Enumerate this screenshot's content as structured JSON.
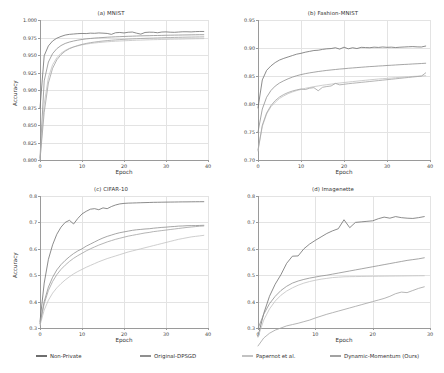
{
  "figure": {
    "xlabel": "Epoch",
    "ylabel": "Accuracy",
    "series_colors": [
      "#6e6e6e",
      "#8f8f8f",
      "#c2c2c2",
      "#a2a2a2"
    ]
  },
  "legend": {
    "position": "bottom",
    "items": [
      {
        "label": "Non-Private",
        "color": "#6e6e6e"
      },
      {
        "label": "Original-DPSGD",
        "color": "#8f8f8f"
      },
      {
        "label": "Papernot et al.",
        "color": "#c2c2c2"
      },
      {
        "label": "Dynamic-Momentum (Ours)",
        "color": "#a2a2a2"
      }
    ]
  },
  "chart_data": [
    {
      "type": "line",
      "title": "(a) MNIST",
      "xlabel": "Epoch",
      "ylabel": "Accuracy",
      "xlim": [
        0,
        40
      ],
      "ylim": [
        0.8,
        1.0
      ],
      "xticks": [
        0,
        10,
        20,
        30,
        40
      ],
      "yticks": [
        0.8,
        0.825,
        0.85,
        0.875,
        0.9,
        0.925,
        0.95,
        0.975,
        1.0
      ],
      "ytick_labels": [
        "0.800",
        "0.825",
        "0.850",
        "0.875",
        "0.900",
        "0.925",
        "0.950",
        "0.975",
        "1.000"
      ],
      "grid": true,
      "x": [
        0,
        1,
        2,
        3,
        4,
        5,
        6,
        7,
        8,
        9,
        10,
        11,
        12,
        13,
        14,
        15,
        16,
        17,
        18,
        19,
        20,
        21,
        22,
        23,
        24,
        25,
        26,
        27,
        28,
        29,
        30,
        31,
        32,
        33,
        34,
        35,
        36,
        37,
        38,
        39
      ],
      "series": [
        {
          "name": "Non-Private",
          "values": [
            0.874,
            0.949,
            0.963,
            0.97,
            0.974,
            0.9765,
            0.9785,
            0.9795,
            0.98,
            0.9805,
            0.9808,
            0.9806,
            0.9812,
            0.981,
            0.9815,
            0.9812,
            0.9808,
            0.9795,
            0.9818,
            0.9822,
            0.9815,
            0.9825,
            0.9828,
            0.9812,
            0.9798,
            0.9822,
            0.9826,
            0.9825,
            0.9818,
            0.9828,
            0.983,
            0.9826,
            0.9824,
            0.9828,
            0.9832,
            0.9832,
            0.983,
            0.9834,
            0.9836,
            0.9836
          ]
        },
        {
          "name": "Original-DPSGD",
          "values": [
            0.803,
            0.913,
            0.94,
            0.952,
            0.959,
            0.9635,
            0.9665,
            0.9685,
            0.97,
            0.9712,
            0.9722,
            0.973,
            0.9736,
            0.9742,
            0.9746,
            0.975,
            0.9754,
            0.9757,
            0.976,
            0.9762,
            0.9765,
            0.9767,
            0.9769,
            0.9771,
            0.9773,
            0.9775,
            0.9776,
            0.9778,
            0.9779,
            0.978,
            0.9782,
            0.9783,
            0.9784,
            0.9785,
            0.9786,
            0.9787,
            0.9788,
            0.9789,
            0.979,
            0.979
          ]
        },
        {
          "name": "Papernot et al.",
          "values": [
            0.801,
            0.88,
            0.918,
            0.936,
            0.946,
            0.9525,
            0.9565,
            0.9595,
            0.9615,
            0.963,
            0.9645,
            0.9655,
            0.9665,
            0.9672,
            0.9678,
            0.9684,
            0.9689,
            0.9693,
            0.9697,
            0.97,
            0.9703,
            0.9706,
            0.9708,
            0.9711,
            0.9713,
            0.9715,
            0.9717,
            0.9719,
            0.972,
            0.9722,
            0.9723,
            0.9725,
            0.9726,
            0.9727,
            0.9728,
            0.973,
            0.9731,
            0.9732,
            0.9733,
            0.9734
          ]
        },
        {
          "name": "Dynamic-Momentum (Ours)",
          "values": [
            0.8,
            0.868,
            0.91,
            0.931,
            0.943,
            0.9505,
            0.9555,
            0.959,
            0.9615,
            0.9635,
            0.9652,
            0.9665,
            0.9676,
            0.9685,
            0.9693,
            0.97,
            0.9706,
            0.9711,
            0.9716,
            0.972,
            0.9724,
            0.9727,
            0.973,
            0.9733,
            0.9736,
            0.9738,
            0.974,
            0.9742,
            0.9744,
            0.9746,
            0.9748,
            0.9749,
            0.9751,
            0.9752,
            0.9754,
            0.9755,
            0.9756,
            0.9757,
            0.9758,
            0.9759
          ]
        }
      ]
    },
    {
      "type": "line",
      "title": "(b) Fashion-MNIST",
      "xlabel": "Epoch",
      "ylabel": "",
      "xlim": [
        0,
        40
      ],
      "ylim": [
        0.7,
        0.95
      ],
      "xticks": [
        0,
        10,
        20,
        30,
        40
      ],
      "yticks": [
        0.7,
        0.75,
        0.8,
        0.85,
        0.9,
        0.95
      ],
      "ytick_labels": [
        "0.70",
        "0.75",
        "0.80",
        "0.85",
        "0.90",
        "0.95"
      ],
      "grid": true,
      "x": [
        0,
        1,
        2,
        3,
        4,
        5,
        6,
        7,
        8,
        9,
        10,
        11,
        12,
        13,
        14,
        15,
        16,
        17,
        18,
        19,
        20,
        21,
        22,
        23,
        24,
        25,
        26,
        27,
        28,
        29,
        30,
        31,
        32,
        33,
        34,
        35,
        36,
        37,
        38,
        39
      ],
      "series": [
        {
          "name": "Non-Private",
          "values": [
            0.793,
            0.843,
            0.86,
            0.868,
            0.874,
            0.8785,
            0.8815,
            0.884,
            0.8865,
            0.889,
            0.8905,
            0.8925,
            0.894,
            0.8955,
            0.896,
            0.8975,
            0.8985,
            0.899,
            0.9005,
            0.898,
            0.9015,
            0.8985,
            0.9005,
            0.899,
            0.9012,
            0.9008,
            0.9005,
            0.9015,
            0.901,
            0.9018,
            0.9012,
            0.9015,
            0.9008,
            0.9014,
            0.9018,
            0.9022,
            0.9025,
            0.902,
            0.9018,
            0.9035
          ]
        },
        {
          "name": "Original-DPSGD",
          "values": [
            0.75,
            0.791,
            0.812,
            0.824,
            0.832,
            0.8375,
            0.8415,
            0.845,
            0.848,
            0.8505,
            0.8525,
            0.8542,
            0.8556,
            0.8568,
            0.858,
            0.859,
            0.86,
            0.8608,
            0.8616,
            0.8624,
            0.863,
            0.8638,
            0.8644,
            0.865,
            0.8656,
            0.8662,
            0.8668,
            0.8672,
            0.8678,
            0.8682,
            0.8688,
            0.8692,
            0.8697,
            0.8702,
            0.8706,
            0.871,
            0.8715,
            0.8719,
            0.8723,
            0.8728
          ]
        },
        {
          "name": "Papernot et al.",
          "values": [
            0.716,
            0.76,
            0.782,
            0.795,
            0.803,
            0.81,
            0.8145,
            0.8185,
            0.8215,
            0.824,
            0.826,
            0.828,
            0.8295,
            0.831,
            0.8322,
            0.8335,
            0.8345,
            0.8355,
            0.8365,
            0.8375,
            0.8384,
            0.8392,
            0.84,
            0.8408,
            0.8416,
            0.8424,
            0.8432,
            0.8439,
            0.8446,
            0.8452,
            0.8458,
            0.8464,
            0.847,
            0.8476,
            0.8482,
            0.8487,
            0.8492,
            0.8496,
            0.85,
            0.8505
          ]
        },
        {
          "name": "Dynamic-Momentum (Ours)",
          "values": [
            0.718,
            0.762,
            0.784,
            0.797,
            0.806,
            0.8125,
            0.817,
            0.8205,
            0.8232,
            0.8252,
            0.8268,
            0.8258,
            0.8282,
            0.8292,
            0.8236,
            0.8298,
            0.8312,
            0.8322,
            0.8368,
            0.8342,
            0.8352,
            0.8362,
            0.837,
            0.8378,
            0.8386,
            0.8394,
            0.8402,
            0.841,
            0.8418,
            0.8426,
            0.8434,
            0.8442,
            0.845,
            0.8458,
            0.8466,
            0.8474,
            0.8482,
            0.849,
            0.8498,
            0.8556
          ]
        }
      ]
    },
    {
      "type": "line",
      "title": "(c) CIFAR-10",
      "xlabel": "Epoch",
      "ylabel": "Accuracy",
      "xlim": [
        0,
        40
      ],
      "ylim": [
        0.3,
        0.8
      ],
      "xticks": [
        0,
        10,
        20,
        30,
        40
      ],
      "yticks": [
        0.3,
        0.4,
        0.5,
        0.6,
        0.7,
        0.8
      ],
      "ytick_labels": [
        "0.3",
        "0.4",
        "0.5",
        "0.6",
        "0.7",
        "0.8"
      ],
      "grid": true,
      "x": [
        0,
        1,
        2,
        3,
        4,
        5,
        6,
        7,
        8,
        9,
        10,
        11,
        12,
        13,
        14,
        15,
        16,
        17,
        18,
        19,
        20,
        21,
        22,
        23,
        24,
        25,
        26,
        27,
        28,
        29,
        30,
        31,
        32,
        33,
        34,
        35,
        36,
        37,
        38,
        39
      ],
      "series": [
        {
          "name": "Non-Private",
          "values": [
            0.325,
            0.47,
            0.56,
            0.615,
            0.655,
            0.682,
            0.7,
            0.708,
            0.694,
            0.715,
            0.732,
            0.742,
            0.75,
            0.752,
            0.748,
            0.755,
            0.752,
            0.76,
            0.766,
            0.77,
            0.772,
            0.773,
            0.7735,
            0.774,
            0.7745,
            0.775,
            0.7755,
            0.776,
            0.7762,
            0.7765,
            0.7768,
            0.777,
            0.7772,
            0.7775,
            0.7777,
            0.7778,
            0.778,
            0.7782,
            0.7783,
            0.7785
          ]
        },
        {
          "name": "Original-DPSGD",
          "values": [
            0.318,
            0.4,
            0.455,
            0.492,
            0.52,
            0.54,
            0.556,
            0.57,
            0.582,
            0.592,
            0.6,
            0.61,
            0.618,
            0.626,
            0.634,
            0.641,
            0.647,
            0.652,
            0.657,
            0.661,
            0.664,
            0.667,
            0.67,
            0.672,
            0.6735,
            0.675,
            0.676,
            0.678,
            0.6795,
            0.681,
            0.682,
            0.6835,
            0.6845,
            0.686,
            0.6865,
            0.6875,
            0.6878,
            0.688,
            0.6885,
            0.689
          ]
        },
        {
          "name": "Papernot et al.",
          "values": [
            0.31,
            0.368,
            0.405,
            0.432,
            0.452,
            0.468,
            0.482,
            0.494,
            0.505,
            0.514,
            0.522,
            0.53,
            0.537,
            0.544,
            0.551,
            0.557,
            0.563,
            0.568,
            0.573,
            0.578,
            0.583,
            0.588,
            0.592,
            0.596,
            0.6,
            0.604,
            0.608,
            0.612,
            0.616,
            0.62,
            0.624,
            0.628,
            0.632,
            0.636,
            0.639,
            0.642,
            0.645,
            0.647,
            0.649,
            0.651
          ]
        },
        {
          "name": "Dynamic-Momentum (Ours)",
          "values": [
            0.316,
            0.392,
            0.442,
            0.476,
            0.502,
            0.522,
            0.538,
            0.552,
            0.564,
            0.574,
            0.583,
            0.592,
            0.6,
            0.607,
            0.614,
            0.62,
            0.626,
            0.631,
            0.636,
            0.64,
            0.644,
            0.648,
            0.651,
            0.654,
            0.657,
            0.66,
            0.662,
            0.665,
            0.667,
            0.669,
            0.671,
            0.673,
            0.675,
            0.677,
            0.679,
            0.681,
            0.6825,
            0.684,
            0.6855,
            0.6865
          ]
        }
      ]
    },
    {
      "type": "line",
      "title": "(d) Imagenette",
      "xlabel": "Epoch",
      "ylabel": "",
      "xlim": [
        0,
        30
      ],
      "ylim": [
        0.3,
        0.8
      ],
      "xticks": [
        0,
        10,
        20,
        30
      ],
      "yticks": [
        0.3,
        0.4,
        0.5,
        0.6,
        0.7,
        0.8
      ],
      "ytick_labels": [
        "0.3",
        "0.4",
        "0.5",
        "0.6",
        "0.7",
        "0.8"
      ],
      "grid": true,
      "x": [
        0,
        1,
        2,
        3,
        4,
        5,
        6,
        7,
        8,
        9,
        10,
        11,
        12,
        13,
        14,
        15,
        16,
        17,
        18,
        19,
        20,
        21,
        22,
        23,
        24,
        25,
        26,
        27,
        28,
        29
      ],
      "series": [
        {
          "name": "Non-Private",
          "values": [
            0.268,
            0.355,
            0.42,
            0.466,
            0.502,
            0.545,
            0.572,
            0.573,
            0.6,
            0.618,
            0.632,
            0.645,
            0.658,
            0.668,
            0.676,
            0.71,
            0.68,
            0.7,
            0.702,
            0.704,
            0.706,
            0.714,
            0.72,
            0.716,
            0.722,
            0.718,
            0.716,
            0.715,
            0.718,
            0.722
          ]
        },
        {
          "name": "Original-DPSGD",
          "values": [
            0.298,
            0.352,
            0.392,
            0.42,
            0.442,
            0.458,
            0.47,
            0.478,
            0.484,
            0.489,
            0.493,
            0.497,
            0.5,
            0.504,
            0.508,
            0.512,
            0.516,
            0.52,
            0.524,
            0.528,
            0.532,
            0.536,
            0.54,
            0.544,
            0.548,
            0.552,
            0.556,
            0.559,
            0.562,
            0.566
          ]
        },
        {
          "name": "Papernot et al.",
          "values": [
            0.265,
            0.33,
            0.372,
            0.402,
            0.424,
            0.44,
            0.452,
            0.462,
            0.47,
            0.476,
            0.481,
            0.485,
            0.488,
            0.491,
            0.4925,
            0.494,
            0.4945,
            0.4948,
            0.4952,
            0.4955,
            0.4958,
            0.496,
            0.4963,
            0.4966,
            0.4968,
            0.497,
            0.4973,
            0.4976,
            0.4978,
            0.498
          ]
        },
        {
          "name": "Dynamic-Momentum (Ours)",
          "values": [
            0.232,
            0.262,
            0.28,
            0.292,
            0.3,
            0.308,
            0.313,
            0.318,
            0.324,
            0.33,
            0.338,
            0.345,
            0.352,
            0.358,
            0.364,
            0.37,
            0.376,
            0.382,
            0.388,
            0.394,
            0.4,
            0.406,
            0.412,
            0.42,
            0.43,
            0.436,
            0.434,
            0.442,
            0.45,
            0.456
          ]
        }
      ]
    }
  ]
}
